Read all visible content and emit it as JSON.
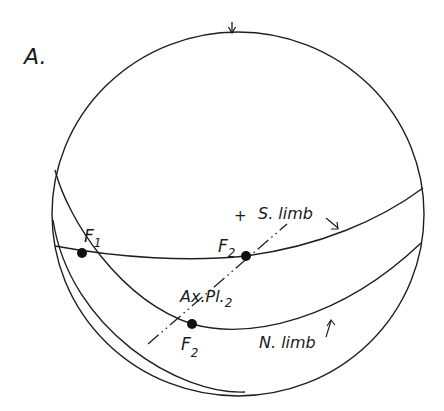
{
  "figure": {
    "panel_label": "A.",
    "colors": {
      "ink": "#1f1f1f",
      "background": "#ffffff"
    },
    "stereonet": {
      "center": [
        238,
        214
      ],
      "radius": 182,
      "north_tick": "down-arrow-at-top"
    },
    "labels": {
      "f1": {
        "main": "F",
        "sub": "1"
      },
      "f2_upper": {
        "main": "F",
        "sub": "2"
      },
      "f2_lower": {
        "main": "F",
        "sub": "2"
      },
      "s_limb": "S. limb",
      "n_limb": "N. limb",
      "axial_plane": {
        "main": "Ax.Pl.",
        "sub": "2"
      },
      "center_mark": "+"
    },
    "great_circles": [
      {
        "name": "S. limb",
        "passes_through": [
          "F1",
          "F2 (upper)"
        ]
      },
      {
        "name": "N. limb",
        "passes_through": [
          "F1",
          "F2 (lower)"
        ]
      }
    ],
    "axial_plane_trace": {
      "name": "Ax.Pl.2",
      "passes_through": [
        "F2 (upper)",
        "F2 (lower)"
      ],
      "style": "dash-dot"
    }
  }
}
